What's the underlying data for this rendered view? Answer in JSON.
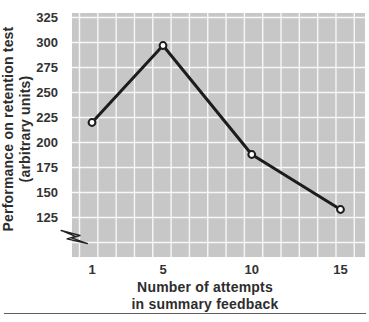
{
  "chart_data": {
    "type": "line",
    "x": [
      1,
      5,
      10,
      15
    ],
    "y": [
      220,
      297,
      188,
      133
    ],
    "x_ticks": [
      "1",
      "5",
      "10",
      "15"
    ],
    "y_ticks": [
      325,
      300,
      275,
      250,
      225,
      200,
      175,
      150,
      125
    ],
    "xlabel_line1": "Number of attempts",
    "xlabel_line2": "in summary feedback",
    "ylabel_line1": "Performance on retention test",
    "ylabel_line2": "(arbitrary units)",
    "x_range": [
      1,
      15
    ],
    "y_range_shown": [
      125,
      325
    ],
    "y_tick_step": 25,
    "axis_break": true,
    "grid": true,
    "legend": "none",
    "colors": {
      "plot_bg": "#c7c7c7",
      "grid": "#f7f7f7",
      "line": "#1c1c1c",
      "marker_fill": "#ffffff",
      "text": "#333333",
      "rule": "#5f5f5f"
    }
  }
}
